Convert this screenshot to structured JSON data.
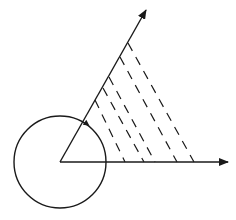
{
  "diagram": {
    "stroke_color": "#1a1a1a",
    "background": "#ffffff",
    "origin": {
      "x": 60,
      "y": 162
    },
    "circle": {
      "cx": 60,
      "cy": 162,
      "r": 46
    },
    "circle_arrow": {
      "x": 87,
      "y": 124,
      "direction": "clockwise"
    },
    "rays": [
      {
        "name": "horizontal-ray",
        "x2": 228,
        "y2": 162
      },
      {
        "name": "oblique-ray",
        "x2": 146,
        "y2": 10
      }
    ],
    "hatch_lines": [
      {
        "x1": 128,
        "y1": 43,
        "x2": 194,
        "y2": 162
      },
      {
        "x1": 120,
        "y1": 57,
        "x2": 177,
        "y2": 162
      },
      {
        "x1": 109,
        "y1": 77,
        "x2": 155,
        "y2": 162
      },
      {
        "x1": 103,
        "y1": 88,
        "x2": 144,
        "y2": 162
      },
      {
        "x1": 95,
        "y1": 100,
        "x2": 125,
        "y2": 162
      }
    ],
    "hatch_dash": "9 7"
  }
}
